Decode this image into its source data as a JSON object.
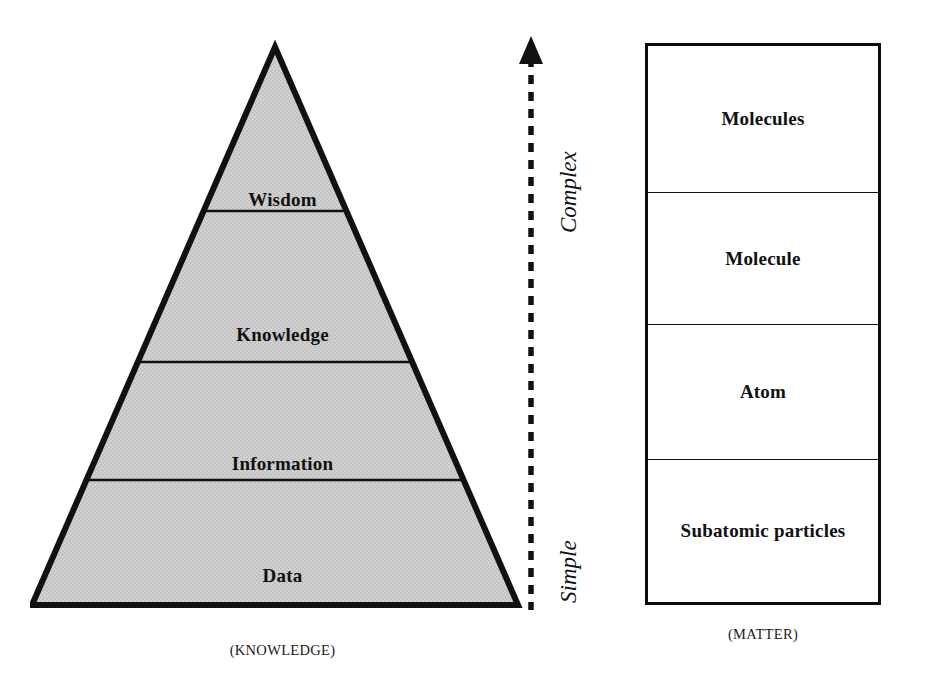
{
  "diagram": {
    "pyramid": {
      "caption": "(KNOWLEDGE)",
      "tiers": [
        {
          "label": "Wisdom"
        },
        {
          "label": "Knowledge"
        },
        {
          "label": "Information"
        },
        {
          "label": "Data"
        }
      ],
      "fill_color": "#cbcbcb",
      "stroke_color": "#111111"
    },
    "axis": {
      "top_label": "Complex",
      "bottom_label": "Simple",
      "style": "dashed-arrow-up",
      "color": "#111111"
    },
    "matter": {
      "caption": "(MATTER)",
      "rows": [
        {
          "label": "Molecules"
        },
        {
          "label": "Molecule"
        },
        {
          "label": "Atom"
        },
        {
          "label": "Subatomic particles"
        }
      ],
      "border_color": "#0d0d0d",
      "fill_color": "#ffffff"
    }
  }
}
